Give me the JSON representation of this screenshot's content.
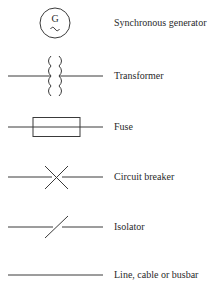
{
  "legend": {
    "items": [
      {
        "symbol": "synchronous-generator",
        "label": "Synchronous generator",
        "glyph_letter": "G",
        "glyph_wave": "~"
      },
      {
        "symbol": "transformer",
        "label": "Transformer"
      },
      {
        "symbol": "fuse",
        "label": "Fuse"
      },
      {
        "symbol": "circuit-breaker",
        "label": "Circuit breaker"
      },
      {
        "symbol": "isolator",
        "label": "Isolator"
      },
      {
        "symbol": "line-cable-busbar",
        "label": "Line, cable or busbar"
      }
    ]
  },
  "colors": {
    "stroke": "#3a3a3a",
    "text": "#2a2a2a",
    "background": "#ffffff"
  }
}
